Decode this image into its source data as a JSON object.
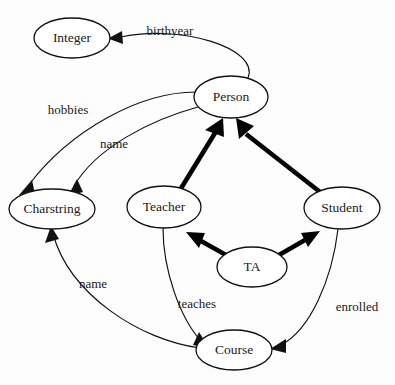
{
  "diagram": {
    "type": "uml-class-association-diagram",
    "background_color": "#fdfdfd",
    "stroke_color": "#111111",
    "width": 395,
    "height": 385,
    "nodes": [
      {
        "id": "integer",
        "label": "Integer",
        "cx": 72,
        "cy": 38,
        "rx": 38,
        "ry": 20
      },
      {
        "id": "person",
        "label": "Person",
        "cx": 231,
        "cy": 97,
        "rx": 37,
        "ry": 21
      },
      {
        "id": "charstring",
        "label": "Charstring",
        "cx": 52,
        "cy": 209,
        "rx": 43,
        "ry": 20
      },
      {
        "id": "teacher",
        "label": "Teacher",
        "cx": 164,
        "cy": 207,
        "rx": 37,
        "ry": 21
      },
      {
        "id": "student",
        "label": "Student",
        "cx": 342,
        "cy": 208,
        "rx": 38,
        "ry": 21
      },
      {
        "id": "ta",
        "label": "TA",
        "cx": 252,
        "cy": 267,
        "rx": 35,
        "ry": 20
      },
      {
        "id": "course",
        "label": "Course",
        "cx": 234,
        "cy": 350,
        "rx": 38,
        "ry": 20
      }
    ],
    "associations": [
      {
        "id": "birthyear",
        "label": "birthyear",
        "from": "person",
        "to": "integer",
        "label_x": 170,
        "label_y": 32
      },
      {
        "id": "hobbies",
        "label": "hobbies",
        "from": "person",
        "to": "charstring",
        "label_x": 68,
        "label_y": 111
      },
      {
        "id": "name-person",
        "label": "name",
        "from": "person",
        "to": "charstring",
        "label_x": 114,
        "label_y": 145
      },
      {
        "id": "name-course",
        "label": "name",
        "from": "course",
        "to": "charstring",
        "label_x": 93,
        "label_y": 285
      },
      {
        "id": "teaches",
        "label": "teaches",
        "from": "teacher",
        "to": "course",
        "label_x": 197,
        "label_y": 305
      },
      {
        "id": "enrolled",
        "label": "enrolled",
        "from": "student",
        "to": "course",
        "label_x": 357,
        "label_y": 308
      }
    ],
    "inheritances": [
      {
        "id": "teacher-person",
        "from": "teacher",
        "to": "person"
      },
      {
        "id": "student-person",
        "from": "student",
        "to": "person"
      },
      {
        "id": "ta-teacher",
        "from": "ta",
        "to": "teacher"
      },
      {
        "id": "ta-student",
        "from": "ta",
        "to": "student"
      }
    ]
  }
}
